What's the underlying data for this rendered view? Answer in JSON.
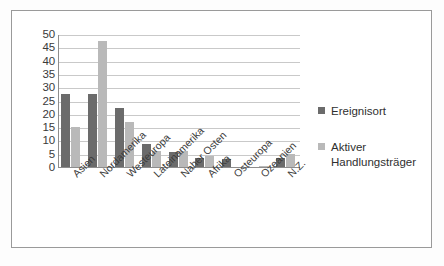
{
  "chart_data": {
    "type": "bar",
    "title": "",
    "subtitle": "",
    "xlabel": "",
    "ylabel": "",
    "ylim": [
      0,
      50
    ],
    "ytick_step": 5,
    "yticks": [
      "50",
      "45",
      "40",
      "35",
      "30",
      "25",
      "20",
      "15",
      "10",
      "5",
      "0"
    ],
    "grid": true,
    "legend_position": "right",
    "categories": [
      "Asien",
      "Nordamerika",
      "Westeuropa",
      "Lateinamerika",
      "Naher Osten",
      "Afrika",
      "Osteuropa",
      "Ozeanien",
      "N.Z."
    ],
    "series": [
      {
        "name": "Ereignisort",
        "color": "#6b6b6b",
        "values": [
          27.5,
          27.5,
          22,
          8.5,
          5.5,
          3.5,
          3,
          0,
          3.5
        ]
      },
      {
        "name": "Aktiver Handlungsträger",
        "color": "#b9b9b9",
        "values": [
          15,
          47.5,
          17,
          6,
          6,
          4,
          0,
          0.5,
          5
        ]
      }
    ]
  },
  "legend": {
    "items": [
      {
        "label": "Ereignisort",
        "swatch_name": "legend-swatch-ereignisort"
      },
      {
        "label": "Aktiver\nHandlungsträger",
        "swatch_name": "legend-swatch-aktiver-handlungstraeger"
      }
    ]
  },
  "colors": {
    "series_dark": "#6b6b6b",
    "series_light": "#b9b9b9",
    "gridline": "#c9c9c9",
    "axis": "#8d8d8d",
    "frame": "#9a9a9a",
    "background": "#ffffff",
    "text": "#3a3a3a"
  }
}
